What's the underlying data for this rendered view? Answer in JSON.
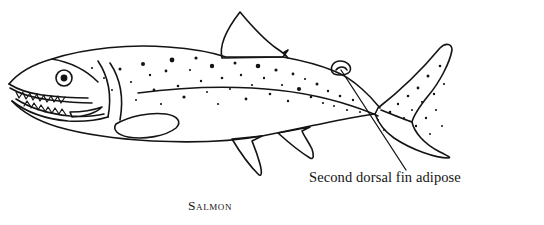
{
  "figure": {
    "subject": "Salmon",
    "caption": "Salmon",
    "style": "black-and-white line engraving",
    "background_color": "#ffffff",
    "ink_color": "#141414"
  },
  "annotations": [
    {
      "id": "adipose-fin",
      "text": "Second dorsal fin adipose",
      "leader_line": {
        "from": {
          "x": 406,
          "y": 170
        },
        "to": {
          "x": 341,
          "y": 70
        }
      },
      "points_to": "adipose-fin"
    }
  ],
  "anatomy": {
    "parts": [
      {
        "name": "snout",
        "label": "snout"
      },
      {
        "name": "jaw",
        "label": "open jaw with teeth"
      },
      {
        "name": "eye",
        "label": "eye"
      },
      {
        "name": "gill-cover",
        "label": "operculum"
      },
      {
        "name": "lateral-line",
        "label": "lateral line"
      },
      {
        "name": "dorsal-fin",
        "label": "first dorsal fin"
      },
      {
        "name": "adipose-fin",
        "label": "second dorsal fin adipose"
      },
      {
        "name": "pectoral-fin",
        "label": "pectoral fin"
      },
      {
        "name": "pelvic-fin",
        "label": "pelvic fin"
      },
      {
        "name": "anal-fin",
        "label": "anal fin"
      },
      {
        "name": "caudal-fin",
        "label": "caudal (tail) fin"
      },
      {
        "name": "body-spots",
        "label": "dark speckled spots"
      }
    ]
  },
  "icons": {
    "eye": "eye-icon",
    "spots": "spot-icon"
  }
}
